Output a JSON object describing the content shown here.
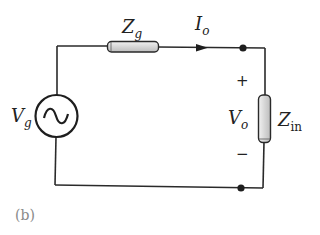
{
  "figure": {
    "label": "(b)"
  },
  "source": {
    "symbol": "V",
    "subscript": "g",
    "type": "ac-voltage-source"
  },
  "series_impedance": {
    "symbol": "Z",
    "subscript": "g"
  },
  "current": {
    "symbol": "I",
    "subscript": "o",
    "direction": "right"
  },
  "output_voltage": {
    "symbol": "V",
    "subscript": "o",
    "plus": "+",
    "minus": "−"
  },
  "load_impedance": {
    "symbol": "Z",
    "subscript": "in"
  },
  "colors": {
    "wire": "#2a2a2a",
    "resistor_fill": "#d9d9d9",
    "label_gray": "#8a8a8a"
  }
}
